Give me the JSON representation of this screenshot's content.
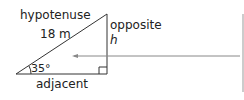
{
  "diagram": {
    "type": "right-triangle",
    "labels": {
      "hypotenuse": "hypotenuse",
      "hypotenuse_length": "18 m",
      "opposite": "opposite",
      "opposite_var": "h",
      "angle": "35°",
      "adjacent": "adjacent"
    },
    "colors": {
      "stroke": "#333333",
      "arrow": "#777777",
      "divider": "#999999"
    }
  }
}
